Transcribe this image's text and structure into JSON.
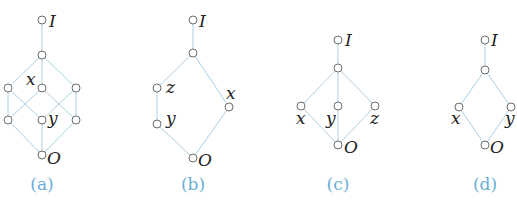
{
  "figure": {
    "colors": {
      "edge": "#a9cfe6",
      "node_stroke": "#6e6e6e",
      "label": "#222222",
      "caption": "#6aaed6"
    },
    "diagrams": [
      {
        "id": "a",
        "caption": "(a)",
        "nodes": [
          {
            "id": "I",
            "x": 42,
            "y": 20,
            "label": "I",
            "lx": 49,
            "ly": 27
          },
          {
            "id": "t",
            "x": 42,
            "y": 55,
            "label": ""
          },
          {
            "id": "l1",
            "x": 8,
            "y": 88,
            "label": ""
          },
          {
            "id": "x",
            "x": 42,
            "y": 88,
            "label": "x",
            "lx": 26,
            "ly": 85
          },
          {
            "id": "r1",
            "x": 76,
            "y": 88,
            "label": ""
          },
          {
            "id": "l2",
            "x": 8,
            "y": 120,
            "label": ""
          },
          {
            "id": "y",
            "x": 42,
            "y": 120,
            "label": "y",
            "lx": 48,
            "ly": 124
          },
          {
            "id": "r2",
            "x": 76,
            "y": 120,
            "label": ""
          },
          {
            "id": "O",
            "x": 42,
            "y": 155,
            "label": "O",
            "lx": 47,
            "ly": 164
          }
        ],
        "edges": [
          [
            "I",
            "t"
          ],
          [
            "t",
            "l1"
          ],
          [
            "t",
            "x"
          ],
          [
            "t",
            "r1"
          ],
          [
            "l1",
            "l2"
          ],
          [
            "l1",
            "y"
          ],
          [
            "x",
            "l2"
          ],
          [
            "x",
            "r2"
          ],
          [
            "r1",
            "y"
          ],
          [
            "r1",
            "r2"
          ],
          [
            "l2",
            "O"
          ],
          [
            "y",
            "O"
          ],
          [
            "r2",
            "O"
          ]
        ]
      },
      {
        "id": "b",
        "caption": "(b)",
        "nodes": [
          {
            "id": "I",
            "x": 193,
            "y": 20,
            "label": "I",
            "lx": 199,
            "ly": 27
          },
          {
            "id": "t",
            "x": 193,
            "y": 53,
            "label": ""
          },
          {
            "id": "z",
            "x": 157,
            "y": 88,
            "label": "z",
            "lx": 166,
            "ly": 93
          },
          {
            "id": "y",
            "x": 157,
            "y": 124,
            "label": "y",
            "lx": 166,
            "ly": 124
          },
          {
            "id": "x",
            "x": 229,
            "y": 107,
            "label": "x",
            "lx": 226,
            "ly": 99
          },
          {
            "id": "O",
            "x": 193,
            "y": 158,
            "label": "O",
            "lx": 198,
            "ly": 166
          }
        ],
        "edges": [
          [
            "I",
            "t"
          ],
          [
            "t",
            "z"
          ],
          [
            "z",
            "y"
          ],
          [
            "y",
            "O"
          ],
          [
            "t",
            "x"
          ],
          [
            "x",
            "O"
          ]
        ]
      },
      {
        "id": "c",
        "caption": "(c)",
        "nodes": [
          {
            "id": "I",
            "x": 338,
            "y": 40,
            "label": "I",
            "lx": 345,
            "ly": 46
          },
          {
            "id": "t",
            "x": 338,
            "y": 68,
            "label": ""
          },
          {
            "id": "x",
            "x": 301,
            "y": 106,
            "label": "x",
            "lx": 296,
            "ly": 124
          },
          {
            "id": "y",
            "x": 338,
            "y": 106,
            "label": "y",
            "lx": 326,
            "ly": 124
          },
          {
            "id": "z",
            "x": 375,
            "y": 106,
            "label": "z",
            "lx": 370,
            "ly": 124
          },
          {
            "id": "O",
            "x": 338,
            "y": 145,
            "label": "O",
            "lx": 344,
            "ly": 153
          }
        ],
        "edges": [
          [
            "I",
            "t"
          ],
          [
            "t",
            "x"
          ],
          [
            "t",
            "y"
          ],
          [
            "t",
            "z"
          ],
          [
            "x",
            "O"
          ],
          [
            "y",
            "O"
          ],
          [
            "z",
            "O"
          ]
        ]
      },
      {
        "id": "d",
        "caption": "(d)",
        "nodes": [
          {
            "id": "I",
            "x": 485,
            "y": 40,
            "label": "I",
            "lx": 491,
            "ly": 46
          },
          {
            "id": "t",
            "x": 485,
            "y": 70,
            "label": ""
          },
          {
            "id": "x",
            "x": 459,
            "y": 107,
            "label": "x",
            "lx": 451,
            "ly": 124
          },
          {
            "id": "y",
            "x": 511,
            "y": 107,
            "label": "y",
            "lx": 505,
            "ly": 124
          },
          {
            "id": "O",
            "x": 485,
            "y": 145,
            "label": "O",
            "lx": 490,
            "ly": 153
          }
        ],
        "edges": [
          [
            "I",
            "t"
          ],
          [
            "t",
            "x"
          ],
          [
            "t",
            "y"
          ],
          [
            "x",
            "O"
          ],
          [
            "y",
            "O"
          ]
        ]
      }
    ],
    "captions": [
      {
        "text": "(a)",
        "x": 42,
        "y": 190
      },
      {
        "text": "(b)",
        "x": 193,
        "y": 190
      },
      {
        "text": "(c)",
        "x": 338,
        "y": 190
      },
      {
        "text": "(d)",
        "x": 485,
        "y": 190
      }
    ]
  }
}
